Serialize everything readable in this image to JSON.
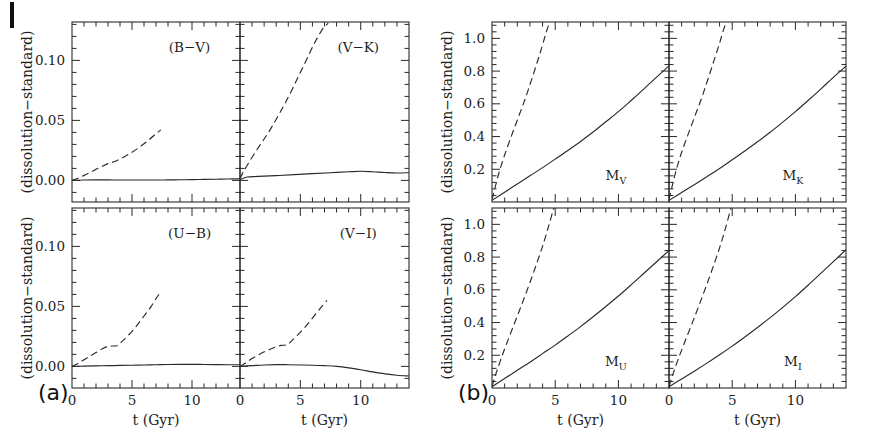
{
  "figure": {
    "group_labels": [
      {
        "id": "a",
        "text": "(a)"
      },
      {
        "id": "b",
        "text": "(b)"
      }
    ],
    "axis_titles": {
      "x": "t (Gyr)",
      "y": "(dissolution−standard)"
    }
  },
  "chart_data": [
    {
      "type": "line",
      "panel": "a-top-left",
      "title": "(B−V)",
      "xlabel": "t (Gyr)",
      "ylabel": "(dissolution−standard)",
      "xlim": [
        0,
        14
      ],
      "ylim": [
        -0.018,
        0.132
      ],
      "xticks": [
        0,
        5,
        10
      ],
      "yticks": [
        0.0,
        0.05,
        0.1
      ],
      "yticklabels": [
        "0.00",
        "0.05",
        "0.10"
      ],
      "xticklabels": [
        "0",
        "5",
        "10"
      ],
      "grid": false,
      "legend": "none",
      "series": [
        {
          "name": "dissolving-cluster-dashed",
          "style": "dashed",
          "x": [
            0.0,
            0.5,
            1.0,
            1.5,
            2.0,
            2.5,
            3.0,
            3.5,
            4.0,
            4.5,
            5.0,
            5.5,
            6.0,
            6.5,
            7.0,
            7.4
          ],
          "y": [
            0.0,
            0.0018,
            0.0042,
            0.0066,
            0.0092,
            0.0116,
            0.014,
            0.0155,
            0.0178,
            0.0205,
            0.0235,
            0.0268,
            0.0305,
            0.0345,
            0.039,
            0.042
          ]
        },
        {
          "name": "standard-solid",
          "style": "solid",
          "x": [
            0.0,
            1.0,
            2.0,
            3.0,
            4.0,
            5.0,
            6.0,
            7.0,
            8.0,
            9.0,
            10.0,
            11.0,
            12.0,
            13.0,
            14.0
          ],
          "y": [
            0.0,
            0.0003,
            0.0004,
            0.0004,
            0.0003,
            0.0003,
            0.0003,
            0.0003,
            0.0004,
            0.0005,
            0.0006,
            0.0008,
            0.001,
            0.0012,
            0.0013
          ]
        }
      ]
    },
    {
      "type": "line",
      "panel": "a-top-right",
      "title": "(V−K)",
      "xlabel": "t (Gyr)",
      "ylabel": "(dissolution−standard)",
      "xlim": [
        0,
        14
      ],
      "ylim": [
        -0.018,
        0.132
      ],
      "xticks": [
        0,
        5,
        10
      ],
      "yticks": [
        0.0,
        0.05,
        0.1
      ],
      "yticklabels": [
        "0.00",
        "0.05",
        "0.10"
      ],
      "xticklabels": [
        "0",
        "5",
        "10"
      ],
      "grid": false,
      "legend": "none",
      "series": [
        {
          "name": "dissolving-cluster-dashed",
          "style": "dashed",
          "x": [
            0.0,
            0.3,
            0.8,
            1.4,
            2.0,
            2.6,
            3.2,
            3.8,
            4.4,
            5.0,
            5.6,
            6.2,
            6.8,
            7.3
          ],
          "y": [
            0.0015,
            0.0075,
            0.016,
            0.0255,
            0.0345,
            0.044,
            0.0545,
            0.0655,
            0.0775,
            0.09,
            0.1025,
            0.115,
            0.1255,
            0.131
          ]
        },
        {
          "name": "standard-solid",
          "style": "solid",
          "x": [
            0.0,
            0.6,
            1.5,
            3.0,
            4.5,
            6.0,
            7.5,
            9.0,
            10.0,
            11.0,
            12.0,
            13.0,
            14.0
          ],
          "y": [
            0.0008,
            0.0028,
            0.0033,
            0.004,
            0.0048,
            0.0056,
            0.0064,
            0.0072,
            0.0076,
            0.0072,
            0.0066,
            0.0062,
            0.0064
          ]
        }
      ]
    },
    {
      "type": "line",
      "panel": "a-bottom-left",
      "title": "(U−B)",
      "xlabel": "t (Gyr)",
      "ylabel": "(dissolution−standard)",
      "xlim": [
        0,
        14
      ],
      "ylim": [
        -0.018,
        0.132
      ],
      "xticks": [
        0,
        5,
        10
      ],
      "yticks": [
        0.0,
        0.05,
        0.1
      ],
      "yticklabels": [
        "0.00",
        "0.05",
        "0.10"
      ],
      "xticklabels": [
        "0",
        "5",
        "10"
      ],
      "grid": false,
      "legend": "none",
      "series": [
        {
          "name": "dissolving-cluster-dashed",
          "style": "dashed",
          "x": [
            0.0,
            0.5,
            1.0,
            1.5,
            2.0,
            2.5,
            3.0,
            3.4,
            3.8,
            4.2,
            4.8,
            5.4,
            6.0,
            6.6,
            7.1,
            7.4
          ],
          "y": [
            0.0,
            0.0025,
            0.0055,
            0.0085,
            0.0115,
            0.0145,
            0.0168,
            0.017,
            0.0175,
            0.021,
            0.027,
            0.034,
            0.042,
            0.05,
            0.058,
            0.062
          ]
        },
        {
          "name": "standard-solid",
          "style": "solid",
          "x": [
            0.0,
            1.0,
            2.0,
            3.0,
            4.0,
            5.0,
            6.0,
            7.0,
            8.0,
            9.0,
            10.0,
            11.0,
            12.0,
            13.0,
            14.0
          ],
          "y": [
            0.0,
            0.0002,
            0.0004,
            0.0006,
            0.0008,
            0.001,
            0.0012,
            0.0014,
            0.0016,
            0.0017,
            0.0017,
            0.0016,
            0.0015,
            0.0014,
            0.0014
          ]
        }
      ]
    },
    {
      "type": "line",
      "panel": "a-bottom-right",
      "title": "(V−I)",
      "xlabel": "t (Gyr)",
      "ylabel": "(dissolution−standard)",
      "xlim": [
        0,
        14
      ],
      "ylim": [
        -0.018,
        0.132
      ],
      "xticks": [
        0,
        5,
        10
      ],
      "yticks": [
        0.0,
        0.05,
        0.1
      ],
      "yticklabels": [
        "0.00",
        "0.05",
        "0.10"
      ],
      "xticklabels": [
        "0",
        "5",
        "10"
      ],
      "grid": false,
      "legend": "none",
      "series": [
        {
          "name": "dissolving-cluster-dashed",
          "style": "dashed",
          "x": [
            0.0,
            0.5,
            1.0,
            1.6,
            2.2,
            2.8,
            3.4,
            3.9,
            4.3,
            4.9,
            5.5,
            6.1,
            6.7,
            7.2
          ],
          "y": [
            0.0,
            0.003,
            0.0065,
            0.01,
            0.013,
            0.0155,
            0.0175,
            0.018,
            0.0215,
            0.0275,
            0.034,
            0.0415,
            0.049,
            0.055
          ]
        },
        {
          "name": "standard-solid",
          "style": "solid",
          "x": [
            0.0,
            1.0,
            2.0,
            3.0,
            4.0,
            5.0,
            6.0,
            7.0,
            8.0,
            9.0,
            10.0,
            11.0,
            12.0,
            13.0,
            14.0
          ],
          "y": [
            0.0,
            0.0006,
            0.0012,
            0.0015,
            0.0014,
            0.0012,
            0.001,
            0.0006,
            0.0,
            -0.0012,
            -0.0028,
            -0.0046,
            -0.0062,
            -0.0074,
            -0.008
          ]
        }
      ]
    },
    {
      "type": "line",
      "panel": "b-top-left",
      "title": "M_V",
      "title_base": "M",
      "title_sub": "V",
      "xlabel": "t (Gyr)",
      "ylabel": "(dissolution−standard)",
      "xlim": [
        0,
        14
      ],
      "ylim": [
        0.0,
        1.1
      ],
      "xticks": [
        0,
        5,
        10
      ],
      "yticks": [
        0.2,
        0.4,
        0.6,
        0.8,
        1.0
      ],
      "yticklabels": [
        "0.2",
        "0.4",
        "0.6",
        "0.8",
        "1.0"
      ],
      "xticklabels": [
        "0",
        "5",
        "10"
      ],
      "grid": false,
      "legend": "none",
      "series": [
        {
          "name": "dissolving-cluster-dashed",
          "style": "dashed",
          "x": [
            0.0,
            0.2,
            0.5,
            0.9,
            1.4,
            2.0,
            2.6,
            3.1,
            3.6,
            4.0,
            4.3,
            4.6
          ],
          "y": [
            0.015,
            0.075,
            0.165,
            0.265,
            0.375,
            0.5,
            0.625,
            0.74,
            0.86,
            0.96,
            1.04,
            1.11
          ]
        },
        {
          "name": "standard-solid",
          "style": "solid",
          "x": [
            0.0,
            1.0,
            2.0,
            3.0,
            4.0,
            5.0,
            6.0,
            7.0,
            8.0,
            9.0,
            10.0,
            11.0,
            12.0,
            13.0,
            14.0
          ],
          "y": [
            0.01,
            0.06,
            0.11,
            0.16,
            0.21,
            0.262,
            0.315,
            0.37,
            0.428,
            0.49,
            0.552,
            0.62,
            0.69,
            0.762,
            0.832
          ]
        }
      ]
    },
    {
      "type": "line",
      "panel": "b-top-right",
      "title": "M_K",
      "title_base": "M",
      "title_sub": "K",
      "xlabel": "t (Gyr)",
      "ylabel": "(dissolution−standard)",
      "xlim": [
        0,
        14
      ],
      "ylim": [
        0.0,
        1.1
      ],
      "xticks": [
        0,
        5,
        10
      ],
      "yticks": [
        0.2,
        0.4,
        0.6,
        0.8,
        1.0
      ],
      "yticklabels": [
        "0.2",
        "0.4",
        "0.6",
        "0.8",
        "1.0"
      ],
      "xticklabels": [
        "0",
        "5",
        "10"
      ],
      "grid": false,
      "legend": "none",
      "series": [
        {
          "name": "dissolving-cluster-dashed",
          "style": "dashed",
          "x": [
            0.0,
            0.2,
            0.5,
            0.9,
            1.4,
            2.0,
            2.6,
            3.1,
            3.6,
            4.0,
            4.3,
            4.6
          ],
          "y": [
            0.015,
            0.08,
            0.175,
            0.28,
            0.39,
            0.515,
            0.64,
            0.755,
            0.875,
            0.97,
            1.05,
            1.11
          ]
        },
        {
          "name": "standard-solid",
          "style": "solid",
          "x": [
            0.0,
            1.0,
            2.0,
            3.0,
            4.0,
            5.0,
            6.0,
            7.0,
            8.0,
            9.0,
            10.0,
            11.0,
            12.0,
            13.0,
            14.0
          ],
          "y": [
            0.01,
            0.058,
            0.106,
            0.155,
            0.205,
            0.258,
            0.312,
            0.368,
            0.426,
            0.488,
            0.552,
            0.62,
            0.69,
            0.762,
            0.83
          ]
        }
      ]
    },
    {
      "type": "line",
      "panel": "b-bottom-left",
      "title": "M_U",
      "title_base": "M",
      "title_sub": "U",
      "xlabel": "t (Gyr)",
      "ylabel": "(dissolution−standard)",
      "xlim": [
        0,
        14
      ],
      "ylim": [
        0.0,
        1.1
      ],
      "xticks": [
        0,
        5,
        10
      ],
      "yticks": [
        0.2,
        0.4,
        0.6,
        0.8,
        1.0
      ],
      "yticklabels": [
        "0.2",
        "0.4",
        "0.6",
        "0.8",
        "1.0"
      ],
      "xticklabels": [
        "0",
        "5",
        "10"
      ],
      "grid": false,
      "legend": "none",
      "series": [
        {
          "name": "dissolving-cluster-dashed",
          "style": "dashed",
          "x": [
            0.0,
            0.3,
            0.7,
            1.2,
            1.8,
            2.4,
            3.0,
            3.6,
            4.1,
            4.5,
            4.9
          ],
          "y": [
            0.01,
            0.085,
            0.175,
            0.28,
            0.4,
            0.52,
            0.645,
            0.775,
            0.89,
            0.995,
            1.105
          ]
        },
        {
          "name": "standard-solid",
          "style": "solid",
          "x": [
            0.0,
            1.0,
            2.0,
            3.0,
            4.0,
            5.0,
            6.0,
            7.0,
            8.0,
            9.0,
            10.0,
            11.0,
            12.0,
            13.0,
            14.0
          ],
          "y": [
            0.008,
            0.058,
            0.108,
            0.158,
            0.21,
            0.262,
            0.318,
            0.375,
            0.435,
            0.498,
            0.562,
            0.63,
            0.7,
            0.77,
            0.84
          ]
        }
      ]
    },
    {
      "type": "line",
      "panel": "b-bottom-right",
      "title": "M_I",
      "title_base": "M",
      "title_sub": "I",
      "xlabel": "t (Gyr)",
      "ylabel": "(dissolution−standard)",
      "xlim": [
        0,
        14
      ],
      "ylim": [
        0.0,
        1.1
      ],
      "xticks": [
        0,
        5,
        10
      ],
      "yticks": [
        0.2,
        0.4,
        0.6,
        0.8,
        1.0
      ],
      "yticklabels": [
        "0.2",
        "0.4",
        "0.6",
        "0.8",
        "1.0"
      ],
      "xticklabels": [
        "0",
        "5",
        "10"
      ],
      "grid": false,
      "legend": "none",
      "series": [
        {
          "name": "dissolving-cluster-dashed",
          "style": "dashed",
          "x": [
            0.0,
            0.3,
            0.7,
            1.2,
            1.8,
            2.4,
            3.0,
            3.6,
            4.1,
            4.5,
            4.9
          ],
          "y": [
            0.01,
            0.082,
            0.17,
            0.272,
            0.39,
            0.51,
            0.635,
            0.765,
            0.88,
            0.985,
            1.1
          ]
        },
        {
          "name": "standard-solid",
          "style": "solid",
          "x": [
            0.0,
            1.0,
            2.0,
            3.0,
            4.0,
            5.0,
            6.0,
            7.0,
            8.0,
            9.0,
            10.0,
            11.0,
            12.0,
            13.0,
            14.0
          ],
          "y": [
            0.008,
            0.055,
            0.103,
            0.152,
            0.203,
            0.256,
            0.312,
            0.37,
            0.43,
            0.493,
            0.558,
            0.628,
            0.7,
            0.772,
            0.845
          ]
        }
      ]
    }
  ]
}
